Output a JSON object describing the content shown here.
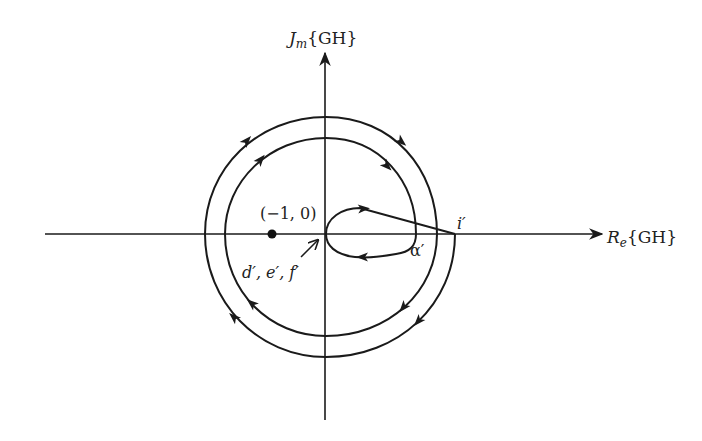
{
  "diagram": {
    "axes": {
      "y_label_main": "J",
      "y_label_sub": "m",
      "y_label_arg": "{GH}",
      "x_label_main": "R",
      "x_label_sub": "e",
      "x_label_arg": "{GH}"
    },
    "points": {
      "critical_point_label": "(−1, 0)",
      "origin_mapping_label": "d′, e′, f′",
      "alpha_label": "α′",
      "i_label": "i′"
    },
    "contour": {
      "direction": "clockwise",
      "encirclements_of_minus_one": 2,
      "line_color": "#1a1a1a"
    }
  }
}
